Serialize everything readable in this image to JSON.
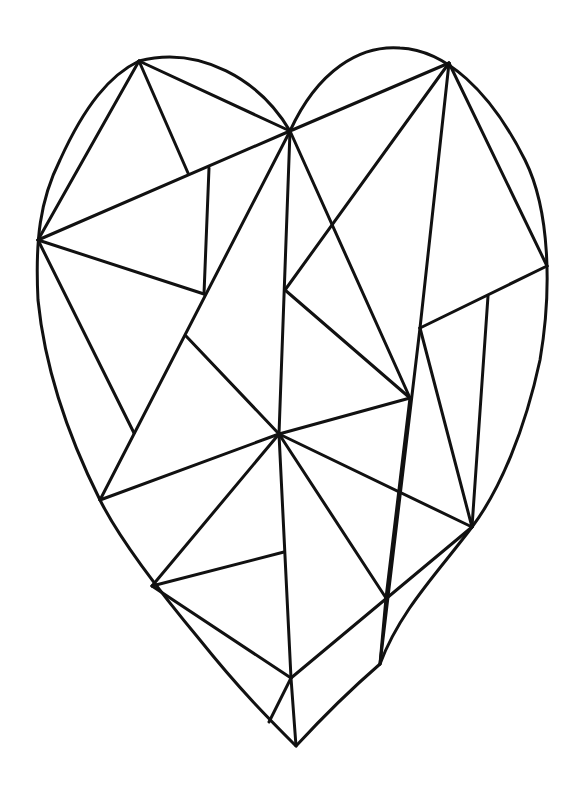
{
  "artwork": {
    "subject": "geometric faceted heart coloring page",
    "stroke_color": "#111111",
    "background_color": "#ffffff",
    "outline": "M290,131 C318,70 360,45 400,48 C445,50 490,90 525,160 C550,210 552,290 540,360 C525,430 500,490 472,527 C440,570 400,610 380,664 C350,690 320,720 296,746 C270,720 240,690 200,640 C150,580 115,530 100,500 C70,440 45,370 38,300 C35,240 40,200 60,160 C85,105 110,75 139,61 C200,45 260,80 290,131 Z",
    "facets": [
      [
        139,
        61,
        290,
        131
      ],
      [
        139,
        61,
        38,
        240
      ],
      [
        139,
        61,
        188,
        173
      ],
      [
        290,
        131,
        38,
        240
      ],
      [
        209,
        168,
        204,
        294
      ],
      [
        38,
        240,
        204,
        294
      ],
      [
        38,
        240,
        134,
        433
      ],
      [
        290,
        131,
        100,
        500
      ],
      [
        290,
        131,
        279,
        434
      ],
      [
        290,
        131,
        410,
        398
      ],
      [
        290,
        131,
        449,
        63
      ],
      [
        449,
        63,
        285,
        290
      ],
      [
        449,
        63,
        420,
        328
      ],
      [
        449,
        63,
        547,
        266
      ],
      [
        547,
        266,
        420,
        328
      ],
      [
        420,
        328,
        472,
        527
      ],
      [
        420,
        328,
        380,
        664
      ],
      [
        488,
        296,
        472,
        527
      ],
      [
        285,
        290,
        410,
        398
      ],
      [
        186,
        336,
        279,
        434
      ],
      [
        279,
        434,
        410,
        398
      ],
      [
        279,
        434,
        100,
        500
      ],
      [
        279,
        434,
        152,
        586
      ],
      [
        279,
        434,
        291,
        678
      ],
      [
        279,
        434,
        386,
        598
      ],
      [
        279,
        434,
        472,
        527
      ],
      [
        152,
        586,
        284,
        552
      ],
      [
        152,
        586,
        291,
        678
      ],
      [
        291,
        678,
        472,
        527
      ],
      [
        291,
        678,
        269,
        722
      ],
      [
        291,
        678,
        296,
        746
      ],
      [
        410,
        398,
        386,
        598
      ],
      [
        386,
        598,
        380,
        664
      ]
    ]
  }
}
